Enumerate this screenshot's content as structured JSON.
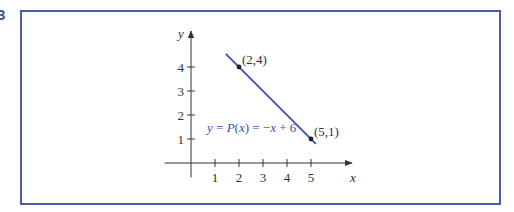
{
  "figure": {
    "number": "3"
  },
  "colors": {
    "frame": "#4d5ca8",
    "line": "#3a4fb0",
    "axis": "#333333",
    "label_text": "#333333",
    "equation_text": "#3a4fb0"
  },
  "chart_data": {
    "type": "line",
    "title": "",
    "xlabel": "x",
    "ylabel": "y",
    "x_ticks": [
      "1",
      "2",
      "3",
      "4",
      "5"
    ],
    "y_ticks": [
      "1",
      "2",
      "3",
      "4"
    ],
    "xlim": [
      -0.2,
      6.7
    ],
    "ylim": [
      -0.6,
      5.4
    ],
    "grid": false,
    "legend": "none",
    "series": [
      {
        "name": "y = P(x) = −x + 6",
        "x": [
          1.45,
          5.2
        ],
        "y": [
          4.55,
          0.8
        ]
      }
    ],
    "points": [
      {
        "x": 2,
        "y": 4,
        "label": "(2,4)"
      },
      {
        "x": 5,
        "y": 1,
        "label": "(5,1)"
      }
    ],
    "annotations": [
      {
        "text": "y = P(x) = −x + 6",
        "x": 0.65,
        "y": 1.3
      }
    ]
  }
}
